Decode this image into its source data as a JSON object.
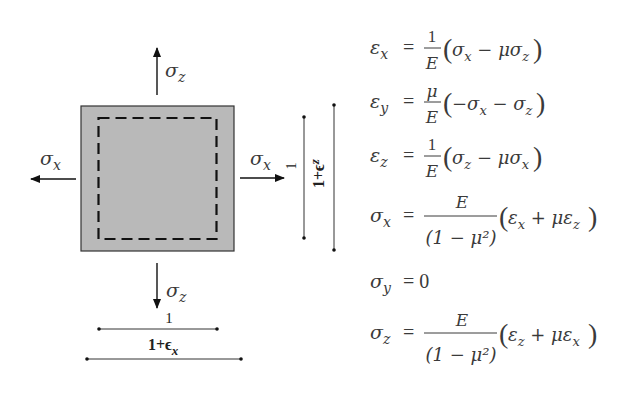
{
  "diagram": {
    "square_fill": "#b9b9b9",
    "stress_labels": {
      "top": {
        "base": "σ",
        "sub": "z"
      },
      "bottom": {
        "base": "σ",
        "sub": "z"
      },
      "left": {
        "base": "σ",
        "sub": "x"
      },
      "right": {
        "base": "σ",
        "sub": "x"
      }
    },
    "dimensions": {
      "bottom_original": "1",
      "bottom_deformed": {
        "base": "1+ϵ",
        "sub": "x"
      },
      "right_original": "1",
      "right_deformed": {
        "base": "1+ϵ",
        "sub": "z"
      }
    }
  },
  "equations": [
    {
      "lhs": {
        "base": "ε",
        "sub": "x"
      },
      "coef_num": "1",
      "coef_den": "E",
      "paren": [
        "σ",
        "x",
        " − μσ",
        "z"
      ]
    },
    {
      "lhs": {
        "base": "ε",
        "sub": "y"
      },
      "coef_num": "μ",
      "coef_den": "E",
      "paren": [
        "−σ",
        "x",
        " − σ",
        "z"
      ]
    },
    {
      "lhs": {
        "base": "ε",
        "sub": "z"
      },
      "coef_num": "1",
      "coef_den": "E",
      "paren": [
        "σ",
        "z",
        " − μσ",
        "x"
      ]
    },
    {
      "lhs": {
        "base": "σ",
        "sub": "x"
      },
      "coef_num": "E",
      "coef_den": "(1 − μ²)",
      "paren": [
        "ε",
        "x",
        " + με",
        "z"
      ]
    },
    {
      "lhs": {
        "base": "σ",
        "sub": "y"
      },
      "rhs": "= 0"
    },
    {
      "lhs": {
        "base": "σ",
        "sub": "z"
      },
      "coef_num": "E",
      "coef_den": "(1 − μ²)",
      "paren": [
        "ε",
        "z",
        " + με",
        "x"
      ]
    }
  ],
  "symbols": {
    "equals": "="
  }
}
